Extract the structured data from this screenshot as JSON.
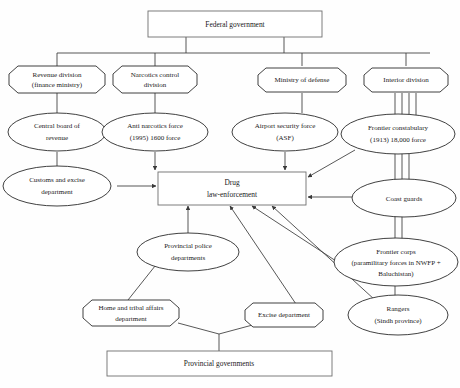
{
  "diagram": {
    "background_color": "#fefefe",
    "line_color": "#3a3a3a",
    "text_color": "#1a1a1a",
    "nodes": {
      "federal_government": {
        "label": "Federal government",
        "shape": "rectangle"
      },
      "revenue_division": {
        "line1": "Revenue division",
        "line2": "(finance ministry)",
        "shape": "octagon"
      },
      "narcotics_control_division": {
        "line1": "Narcotics control",
        "line2": "division",
        "shape": "octagon"
      },
      "ministry_of_defense": {
        "label": "Ministry of defense",
        "shape": "octagon"
      },
      "interior_division": {
        "label": "Interior division",
        "shape": "octagon"
      },
      "central_board_of_revenue": {
        "line1": "Central board of",
        "line2": "revenue",
        "shape": "ellipse"
      },
      "anti_narcotics_force": {
        "line1": "Anti narcotics force",
        "line2": "(1995) 1600 force",
        "shape": "ellipse"
      },
      "airport_security_force": {
        "line1": "Airport security force",
        "line2": "(ASF)",
        "shape": "ellipse"
      },
      "frontier_constabulary": {
        "line1": "Frontier constabulary",
        "line2": "(1913) 18,000 force",
        "shape": "ellipse"
      },
      "customs_and_excise_department": {
        "line1": "Customs and excise",
        "line2": "department",
        "shape": "ellipse"
      },
      "drug_law_enforcement": {
        "line1": "Drug",
        "line2": "law-enforcement",
        "shape": "rectangle"
      },
      "coast_guards": {
        "label": "Coast guards",
        "shape": "ellipse"
      },
      "provincial_police_departments": {
        "line1": "Provincial police",
        "line2": "departments",
        "shape": "ellipse"
      },
      "frontier_corps": {
        "line1": "Frontier corps",
        "line2": "(paramilitary forces in NWFP +",
        "line3": "Baluchistan)",
        "shape": "ellipse"
      },
      "home_and_tribal_affairs_department": {
        "line1": "Home and tribal affairs",
        "line2": "department",
        "shape": "octagon"
      },
      "excise_department": {
        "label": "Excise department",
        "shape": "octagon"
      },
      "rangers": {
        "line1": "Rangers",
        "line2": "(Sindh province)",
        "shape": "ellipse"
      },
      "provincial_governments": {
        "label": "Provincial governments",
        "shape": "rectangle"
      }
    }
  }
}
